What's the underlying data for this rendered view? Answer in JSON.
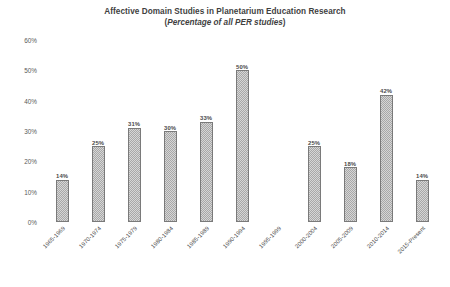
{
  "chart_data": {
    "type": "bar",
    "title": "Affective Domain Studies in Planetarium Education Research",
    "subtitle": "(Percentage of all PER studies)",
    "subtitle_open_paren": "(",
    "subtitle_italic": "Percentage of all PER studies",
    "subtitle_close_paren": ")",
    "xlabel": "",
    "ylabel": "",
    "ylim": [
      0,
      60
    ],
    "grid": false,
    "legend": "none",
    "bar_color": "#d6d6d6",
    "bar_border_color": "#7a7a7a",
    "categories": [
      "1965-1969",
      "1970-1974",
      "1975-1979",
      "1980-1984",
      "1985-1989",
      "1990-1994",
      "1995-1999",
      "2000-2004",
      "2005-2009",
      "2010-2014",
      "2015-Present"
    ],
    "values": [
      14,
      25,
      31,
      30,
      33,
      50,
      null,
      25,
      18,
      42,
      14
    ],
    "value_labels": [
      "14%",
      "25%",
      "31%",
      "30%",
      "33%",
      "50%",
      "",
      "25%",
      "18%",
      "42%",
      "14%"
    ],
    "ytick_values": [
      0,
      10,
      20,
      30,
      40,
      50,
      60
    ],
    "ytick_labels": [
      "0%",
      "10%",
      "20%",
      "30%",
      "40%",
      "50%",
      "60%"
    ]
  }
}
